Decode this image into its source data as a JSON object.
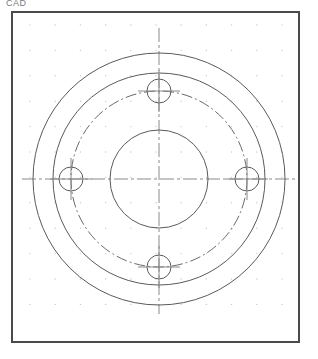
{
  "app": {
    "title_partial": "CAD",
    "canvas_label": "drawing-canvas"
  },
  "frame": {
    "x": 11,
    "y": 11,
    "width": 289,
    "height": 332,
    "stroke": "#4a4a4a",
    "stroke_width": 2,
    "fill": "#ffffff"
  },
  "grid": {
    "name": "snap-dot-grid",
    "origin_x": 30,
    "origin_y": 25,
    "spacing_x": 25.2,
    "spacing_y": 25.4,
    "cols": 11,
    "rows": 12,
    "dot_radius": 0.7,
    "color": "#c9c9c9"
  },
  "part": {
    "name": "flange-plate",
    "center_x": 159,
    "center_y": 179,
    "outer_circle": {
      "name": "outer-diameter",
      "radius": 126,
      "style": "solid",
      "color": "#5a5a5a",
      "width": 1
    },
    "second_circle": {
      "name": "step-diameter",
      "radius": 106,
      "style": "solid",
      "color": "#5a5a5a",
      "width": 1
    },
    "bolt_circle": {
      "name": "bolt-circle-centerline",
      "radius": 88,
      "style": "dash-dot",
      "color": "#6a6a6a",
      "width": 1
    },
    "bore_circle": {
      "name": "center-bore",
      "radius": 49,
      "style": "solid",
      "color": "#5a5a5a",
      "width": 1
    }
  },
  "bolt_holes": [
    {
      "name": "bolt-hole-north",
      "cx": 159,
      "cy": 91,
      "radius": 12,
      "angle_deg": 90
    },
    {
      "name": "bolt-hole-east",
      "cx": 247,
      "cy": 179,
      "radius": 12,
      "angle_deg": 0
    },
    {
      "name": "bolt-hole-south",
      "cx": 159,
      "cy": 267,
      "radius": 12,
      "angle_deg": 270
    },
    {
      "name": "bolt-hole-west",
      "cx": 71,
      "cy": 179,
      "radius": 12,
      "angle_deg": 180
    }
  ],
  "centerlines": {
    "name": "center-axis-lines",
    "color": "#8a8a8a",
    "width": 1,
    "dash_pattern": "14 3 3 3",
    "horizontal": {
      "x1": 22,
      "y1": 179,
      "x2": 296,
      "y2": 179
    },
    "vertical": {
      "x1": 159,
      "y1": 28,
      "x2": 159,
      "y2": 314
    },
    "hole_tick_len": 9,
    "hole_tick_color": "#8a8a8a"
  },
  "colors": {
    "background": "#ffffff",
    "frame_stroke": "#4a4a4a",
    "geometry_stroke": "#5a5a5a",
    "centerline_stroke": "#8a8a8a",
    "grid_dot": "#c9c9c9",
    "title_text": "#7a7a7a"
  }
}
